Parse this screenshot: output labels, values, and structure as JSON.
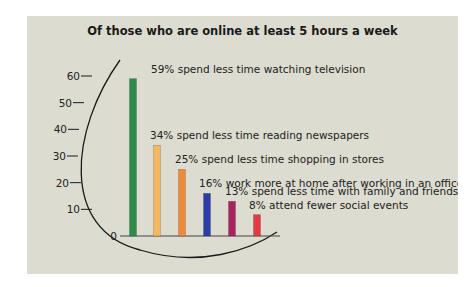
{
  "chart_data": {
    "type": "bar",
    "title": "Of those who are online at least 5 hours a week",
    "xlabel": "",
    "ylabel": "",
    "ylim": [
      0,
      60
    ],
    "yticks": [
      0,
      10,
      20,
      30,
      40,
      50,
      60
    ],
    "grid": false,
    "legend": "none (direct labels)",
    "categories": [
      "spend less time watching television",
      "spend less time reading newspapers",
      "spend less time shopping in stores",
      "work more at home after working in an office",
      "spend less time with family and friends",
      "attend fewer social events"
    ],
    "values": [
      59,
      34,
      25,
      16,
      13,
      8
    ],
    "labels": [
      "59% spend less time watching television",
      "34% spend less time reading newspapers",
      "25% spend less time shopping in stores",
      "16% work more at home after working in an office",
      "13% spend less time with family and friends",
      "8% attend fewer social events"
    ],
    "colors": [
      "#2e8b4a",
      "#f4b860",
      "#ee8a3a",
      "#2b3ea8",
      "#a8245e",
      "#e23a44"
    ]
  }
}
